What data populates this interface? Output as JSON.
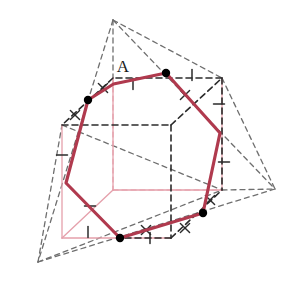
{
  "figure": {
    "label_A": "A",
    "colors": {
      "section_polygon": "#b03a4e",
      "cube_edges_dark": "#2b2b2b",
      "cube_edges_light": "#e5a0ab",
      "tetrahedron_edges": "#6f6f6f",
      "vertex_dot": "#000000",
      "background": "#ffffff",
      "tick_dark": "#2b2b2b",
      "tick_light": "#c8808e"
    },
    "canvas": {
      "width": 290,
      "height": 287
    }
  },
  "geometry": {
    "section_polygon": {
      "name": "section-polygon",
      "closed": true,
      "stroke_width": 3.2,
      "points": [
        [
          113.5,
          84.0
        ],
        [
          166.0,
          73.0
        ],
        [
          220.0,
          133.0
        ],
        [
          203.0,
          213.0
        ],
        [
          120.0,
          238.0
        ],
        [
          66.0,
          183.0
        ],
        [
          88.0,
          100.0
        ]
      ]
    },
    "vertex_dots": {
      "name": "section-vertex-dots",
      "radius": 4.2,
      "points": [
        [
          166.0,
          73.0
        ],
        [
          88.0,
          100.0
        ],
        [
          120.0,
          238.0
        ],
        [
          203.0,
          213.0
        ]
      ]
    },
    "cube_dark": {
      "name": "cube-dark-edges",
      "dash": "6,4",
      "stroke_width": 1.6,
      "segments": [
        [
          [
            62.0,
            125.0
          ],
          [
            171.0,
            125.0
          ]
        ],
        [
          [
            171.0,
            125.0
          ],
          [
            222.0,
            78.0
          ]
        ],
        [
          [
            222.0,
            78.0
          ],
          [
            113.0,
            78.0
          ]
        ],
        [
          [
            113.0,
            78.0
          ],
          [
            62.0,
            125.0
          ]
        ],
        [
          [
            171.0,
            125.0
          ],
          [
            171.0,
            238.0
          ]
        ],
        [
          [
            222.0,
            78.0
          ],
          [
            222.0,
            190.0
          ]
        ],
        [
          [
            171.0,
            238.0
          ],
          [
            222.0,
            190.0
          ]
        ],
        [
          [
            171.0,
            238.0
          ],
          [
            120.0,
            238.0
          ]
        ]
      ]
    },
    "cube_light": {
      "name": "cube-light-edges",
      "stroke_width": 1.3,
      "segments": [
        [
          [
            62.0,
            125.0
          ],
          [
            62.0,
            238.0
          ]
        ],
        [
          [
            62.0,
            238.0
          ],
          [
            171.0,
            238.0
          ]
        ],
        [
          [
            113.0,
            78.0
          ],
          [
            113.0,
            190.0
          ]
        ],
        [
          [
            113.0,
            190.0
          ],
          [
            62.0,
            238.0
          ]
        ],
        [
          [
            113.0,
            190.0
          ],
          [
            222.0,
            190.0
          ]
        ],
        [
          [
            222.0,
            190.0
          ],
          [
            222.0,
            78.0
          ]
        ]
      ]
    },
    "cube_light_dashes": {
      "name": "cube-light-hidden-edges",
      "dash": "5,4",
      "stroke_width": 1.2,
      "segments": [
        [
          [
            113.0,
            190.0
          ],
          [
            222.0,
            190.0
          ]
        ],
        [
          [
            113.0,
            78.0
          ],
          [
            113.0,
            190.0
          ]
        ]
      ]
    },
    "tetrahedron": {
      "name": "tetrahedron-edges",
      "dash": "5,4",
      "stroke_width": 1.3,
      "apex": [
        113.0,
        20.0
      ],
      "right": [
        275.0,
        189.0
      ],
      "bottom_left": [
        38.0,
        262.0
      ],
      "back": [
        62.0,
        125.0
      ],
      "segments": [
        [
          [
            113.0,
            20.0
          ],
          [
            275.0,
            189.0
          ]
        ],
        [
          [
            113.0,
            20.0
          ],
          [
            38.0,
            262.0
          ]
        ],
        [
          [
            113.0,
            20.0
          ],
          [
            113.0,
            78.0
          ]
        ],
        [
          [
            38.0,
            262.0
          ],
          [
            275.0,
            189.0
          ]
        ],
        [
          [
            38.0,
            262.0
          ],
          [
            222.0,
            190.0
          ]
        ],
        [
          [
            38.0,
            262.0
          ],
          [
            62.0,
            125.0
          ]
        ],
        [
          [
            62.0,
            125.0
          ],
          [
            222.0,
            190.0
          ]
        ],
        [
          [
            222.0,
            190.0
          ],
          [
            275.0,
            189.0
          ]
        ],
        [
          [
            113.0,
            20.0
          ],
          [
            222.0,
            78.0
          ]
        ],
        [
          [
            222.0,
            78.0
          ],
          [
            275.0,
            189.0
          ]
        ]
      ]
    },
    "tick_marks": {
      "name": "equal-length-ticks",
      "single": [
        [
          133.0,
          84.0,
          90
        ],
        [
          192.0,
          75.0,
          90
        ],
        [
          219.0,
          104.0,
          0
        ],
        [
          224.0,
          162.0,
          0
        ],
        [
          150.0,
          238.0,
          90
        ],
        [
          88.0,
          232.0,
          90
        ],
        [
          62.0,
          155.0,
          0
        ],
        [
          90.0,
          206.0,
          0
        ]
      ],
      "cross": [
        [
          103.0,
          88.0
        ],
        [
          75.0,
          115.0
        ],
        [
          185.0,
          95.0
        ],
        [
          210.0,
          200.0
        ],
        [
          185.0,
          228.0
        ],
        [
          146.0,
          230.0
        ]
      ]
    },
    "label_A_position": [
      123.0,
      72.0
    ],
    "label_A_leader": [
      [
        113.0,
        84.0
      ],
      [
        166.0,
        73.0
      ]
    ]
  }
}
